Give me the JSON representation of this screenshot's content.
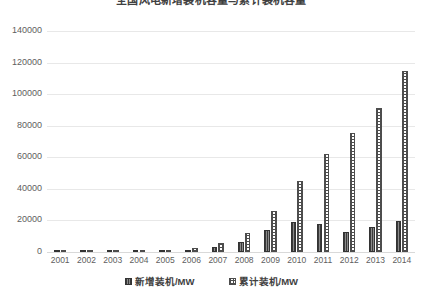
{
  "chart_data": {
    "type": "bar",
    "title": "全国风电新增装机容量与累计装机容量",
    "xlabel": "",
    "ylabel": "",
    "ylim": [
      0,
      140000
    ],
    "yticks": [
      0,
      20000,
      40000,
      60000,
      80000,
      100000,
      120000,
      140000
    ],
    "ytick_labels": [
      "0",
      "20000",
      "40000",
      "60000",
      "80000",
      "100000",
      "120000",
      "140000"
    ],
    "grid": true,
    "legend_position": "bottom",
    "categories": [
      "2001",
      "2002",
      "2003",
      "2004",
      "2005",
      "2006",
      "2007",
      "2008",
      "2009",
      "2010",
      "2011",
      "2012",
      "2013",
      "2014"
    ],
    "series": [
      {
        "name": "新增装机/MW",
        "pattern": "solid-dark-vertical-stripe",
        "values": [
          55,
          68,
          98,
          197,
          503,
          1337,
          3304,
          6300,
          13803,
          18928,
          17631,
          12960,
          16089,
          19810
        ]
      },
      {
        "name": "累计装机/MW",
        "pattern": "checkered-crosshatch",
        "values": [
          399,
          468,
          567,
          764,
          1266,
          2599,
          5906,
          12210,
          25805,
          44733,
          62364,
          75324,
          91413,
          114609
        ]
      }
    ]
  },
  "axis": {
    "y_tick_labels": [
      "140000",
      "120000",
      "100000",
      "80000",
      "60000",
      "40000",
      "20000",
      "0"
    ]
  },
  "legend": {
    "items": [
      {
        "label": "新增装机/MW",
        "swatch": "series-new"
      },
      {
        "label": "累计装机/MW",
        "swatch": "series-cum"
      }
    ]
  }
}
